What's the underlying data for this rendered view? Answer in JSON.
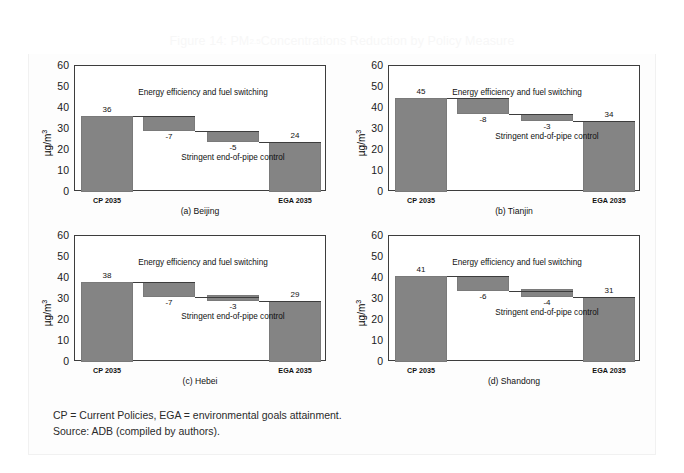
{
  "figure": {
    "title_prefix": "Figure 14: PM",
    "title_sub": "2.5",
    "title_suffix": " Concentrations Reduction by Policy Measure",
    "title_full": "Figure 14: PM2.5 Concentrations Reduction by Policy Measure",
    "bar_color": "#848484",
    "axis_color": "#3d3d3d",
    "title_color": "#f7f7f7"
  },
  "axis": {
    "ylabel_text": "µg/m",
    "ylabel_sup": "3",
    "yticks": [
      "60",
      "50",
      "40",
      "30",
      "20",
      "10",
      "0"
    ],
    "ymin": 0,
    "ymax": 60,
    "xtick_start": "CP 2035",
    "xtick_end": "EGA 2035"
  },
  "annotations": {
    "upper": "Energy efficiency and fuel switching",
    "lower": "Stringent end-of-pipe control"
  },
  "footer": {
    "line1": "CP = Current Policies, EGA = environmental goals attainment.",
    "line2": "Source: ADB (compiled by authors)."
  },
  "chart_data": [
    {
      "type": "bar",
      "subtype": "waterfall",
      "title": "(a) Beijing",
      "panel": "a",
      "xlabel": "",
      "ylabel": "µg/m3",
      "ylim": [
        0,
        60
      ],
      "yticks": [
        0,
        10,
        20,
        30,
        40,
        50,
        60
      ],
      "grid": false,
      "categories": [
        "CP 2035",
        "Energy efficiency and fuel switching",
        "Stringent end-of-pipe control",
        "EGA 2035"
      ],
      "labels": [
        "36",
        "-7",
        "-5",
        "24"
      ],
      "values": [
        36,
        -7,
        -5,
        24
      ],
      "bar_bases": [
        0,
        29,
        24,
        0
      ],
      "bar_tops": [
        36,
        36,
        29,
        24
      ],
      "annotation_upper": "Energy efficiency and fuel switching",
      "annotation_lower": "Stringent end-of-pipe control"
    },
    {
      "type": "bar",
      "subtype": "waterfall",
      "title": "(b) Tianjin",
      "panel": "b",
      "xlabel": "",
      "ylabel": "µg/m3",
      "ylim": [
        0,
        60
      ],
      "yticks": [
        0,
        10,
        20,
        30,
        40,
        50,
        60
      ],
      "grid": false,
      "categories": [
        "CP 2035",
        "Energy efficiency and fuel switching",
        "Stringent end-of-pipe control",
        "EGA 2035"
      ],
      "labels": [
        "45",
        "-8",
        "-3",
        "34"
      ],
      "values": [
        45,
        -8,
        -3,
        34
      ],
      "bar_bases": [
        0,
        37,
        34,
        0
      ],
      "bar_tops": [
        45,
        45,
        37,
        34
      ],
      "annotation_upper": "Energy efficiency and fuel switching",
      "annotation_lower": "Stringent end-of-pipe control"
    },
    {
      "type": "bar",
      "subtype": "waterfall",
      "title": "(c) Hebei",
      "panel": "c",
      "xlabel": "",
      "ylabel": "µg/m3",
      "ylim": [
        0,
        60
      ],
      "yticks": [
        0,
        10,
        20,
        30,
        40,
        50,
        60
      ],
      "grid": false,
      "categories": [
        "CP 2035",
        "Energy efficiency and fuel switching",
        "Stringent end-of-pipe control",
        "EGA 2035"
      ],
      "labels": [
        "38",
        "-7",
        "-3",
        "29"
      ],
      "values": [
        38,
        -7,
        -3,
        29
      ],
      "bar_bases": [
        0,
        31,
        29,
        0
      ],
      "bar_tops": [
        38,
        38,
        32,
        29
      ],
      "annotation_upper": "Energy efficiency and fuel switching",
      "annotation_lower": "Stringent end-of-pipe control"
    },
    {
      "type": "bar",
      "subtype": "waterfall",
      "title": "(d) Shandong",
      "panel": "d",
      "xlabel": "",
      "ylabel": "µg/m3",
      "ylim": [
        0,
        60
      ],
      "yticks": [
        0,
        10,
        20,
        30,
        40,
        50,
        60
      ],
      "grid": false,
      "categories": [
        "CP 2035",
        "Energy efficiency and fuel switching",
        "Stringent end-of-pipe control",
        "EGA 2035"
      ],
      "labels": [
        "41",
        "-6",
        "-4",
        "31"
      ],
      "values": [
        41,
        -6,
        -4,
        31
      ],
      "bar_bases": [
        0,
        34,
        31,
        0
      ],
      "bar_tops": [
        41,
        41,
        35,
        31
      ],
      "annotation_upper": "Energy efficiency and fuel switching",
      "annotation_lower": "Stringent end-of-pipe control"
    }
  ]
}
